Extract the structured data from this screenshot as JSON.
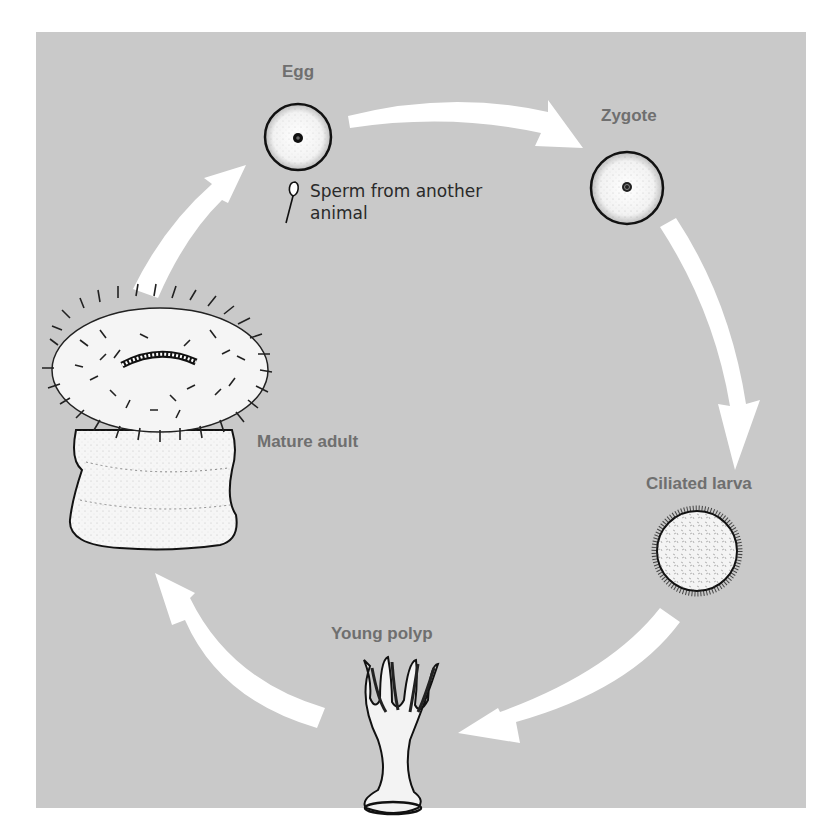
{
  "diagram": {
    "type": "life-cycle",
    "background_color": "#c9c9c9",
    "arrow_color": "#ffffff",
    "label_color": "#6f6f6f",
    "stages": [
      {
        "id": "egg",
        "label": "Egg"
      },
      {
        "id": "zygote",
        "label": "Zygote"
      },
      {
        "id": "ciliated-larva",
        "label": "Ciliated larva"
      },
      {
        "id": "young-polyp",
        "label": "Young polyp"
      },
      {
        "id": "mature-adult",
        "label": "Mature adult"
      }
    ],
    "annotations": {
      "sperm_line1": "Sperm from another",
      "sperm_line2": "animal"
    },
    "flow": [
      "egg",
      "zygote",
      "ciliated-larva",
      "young-polyp",
      "mature-adult",
      "egg"
    ]
  }
}
